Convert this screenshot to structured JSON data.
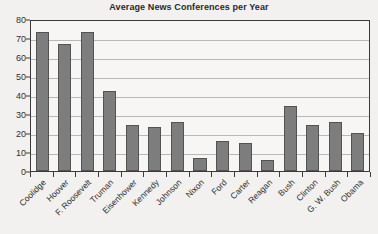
{
  "chart_data": {
    "type": "bar",
    "title": "Average News Conferences per Year",
    "xlabel": "",
    "ylabel": "",
    "ylim": [
      0,
      80
    ],
    "yticks": [
      0,
      10,
      20,
      30,
      40,
      50,
      60,
      70,
      80
    ],
    "grid": true,
    "legend": false,
    "bar_color": "#7d7d7d",
    "bar_edge_color": "#535353",
    "categories": [
      "Coolidge",
      "Hoover",
      "F. Roosevelt",
      "Truman",
      "Eisenhower",
      "Kennedy",
      "Johnson",
      "Nixon",
      "Ford",
      "Carter",
      "Reagan",
      "Bush",
      "Clinton",
      "G. W. Bush",
      "Obama"
    ],
    "values": [
      73,
      67,
      73,
      42,
      24,
      23,
      26,
      7,
      16,
      15,
      6,
      34,
      24,
      26,
      20
    ]
  }
}
